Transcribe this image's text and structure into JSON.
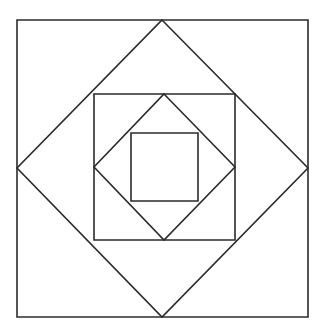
{
  "figure": {
    "background_color": "#ffffff",
    "stroke_color": "#2b2b2b",
    "stroke_width": 1.6,
    "canvas": {
      "width": 317,
      "height": 333
    },
    "shapes": [
      {
        "id": "outer-square",
        "name": "outer-square",
        "orientation": "axis-aligned",
        "level": 1,
        "points": "17,20 308,20 308,317 17,317"
      },
      {
        "id": "outer-diamond",
        "name": "outer-diamond",
        "orientation": "rotated-45",
        "level": 2,
        "points": "162,20 308,168 162,317 17,168"
      },
      {
        "id": "middle-square",
        "name": "middle-square",
        "orientation": "axis-aligned",
        "level": 3,
        "points": "94,94 235,94 235,240 94,240"
      },
      {
        "id": "inner-diamond",
        "name": "inner-diamond",
        "orientation": "rotated-45",
        "level": 4,
        "points": "164,94 235,167 164,240 94,167"
      },
      {
        "id": "inner-square",
        "name": "inner-square",
        "orientation": "axis-aligned",
        "level": 5,
        "points": "131,133 198,133 198,201 131,201"
      }
    ]
  }
}
